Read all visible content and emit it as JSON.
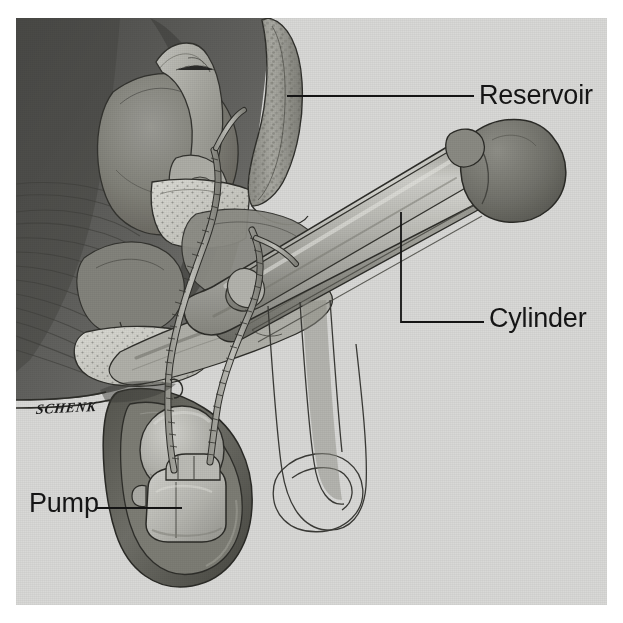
{
  "figure": {
    "artist_signature": "SCHENK",
    "background_color": "#ffffff",
    "plate_color": "#d8d8d6",
    "ink_color": "#151515"
  },
  "labels": [
    {
      "id": "reservoir",
      "text": "Reservoir",
      "leader": {
        "type": "straight",
        "from_x": 287,
        "from_y": 96,
        "to_x": 474,
        "to_y": 96
      },
      "target": "reservoir-balloon"
    },
    {
      "id": "cylinder",
      "text": "Cylinder",
      "leader": {
        "type": "elbow",
        "from_x": 401,
        "from_y": 212,
        "corner_x": 401,
        "corner_y": 322,
        "to_x": 484,
        "to_y": 322
      },
      "target": "penile-cylinder"
    },
    {
      "id": "pump",
      "text": "Pump",
      "leader": {
        "type": "straight",
        "from_x": 96,
        "from_y": 508,
        "to_x": 182,
        "to_y": 508
      },
      "target": "scrotal-pump"
    }
  ],
  "anatomy": {
    "structures": [
      "bladder",
      "prostate",
      "seminal-vesicle",
      "rectum",
      "pubic-bone",
      "pelvic-muscle",
      "urethra",
      "corpus-cavernosum",
      "glans-penis",
      "scrotum",
      "testicle"
    ]
  },
  "device": {
    "components": [
      {
        "name": "reservoir-balloon",
        "description": "fluid reservoir placed behind pubic bone"
      },
      {
        "name": "penile-cylinder",
        "description": "inflatable cylinder implanted in corpus cavernosum"
      },
      {
        "name": "scrotal-pump",
        "description": "pump bulb placed in scrotum"
      },
      {
        "name": "connecting-tubing",
        "description": "tubing joining reservoir, cylinders and pump"
      }
    ]
  },
  "colors": {
    "plate_bg": "#d9d9d7",
    "deep_tissue": "#555552",
    "dark_tissue": "#6e6e6a",
    "mid_tissue": "#8f8f8a",
    "light_tissue": "#b5b5b0",
    "pale_tissue": "#c9c9c4",
    "highlight": "#e3e3df",
    "outline": "#2a2a28",
    "soft_outline": "#4a4a47"
  }
}
